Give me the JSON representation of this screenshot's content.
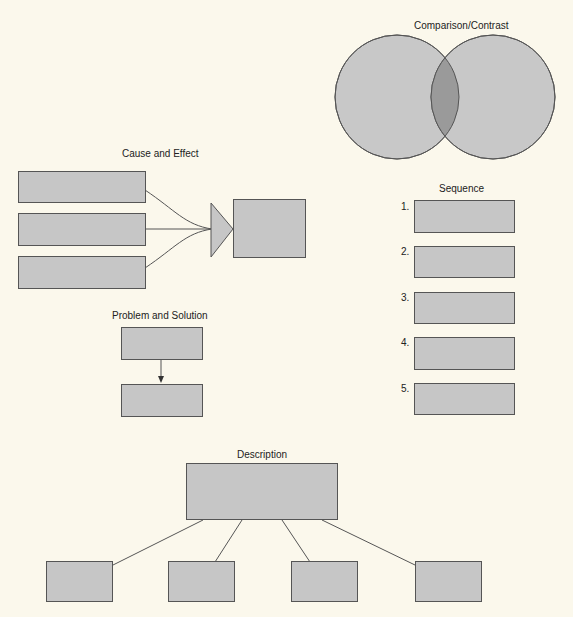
{
  "diagrams": {
    "comparison": {
      "title": "Comparison/Contrast"
    },
    "cause_effect": {
      "title": "Cause and Effect"
    },
    "sequence": {
      "title": "Sequence",
      "steps": [
        "1.",
        "2.",
        "3.",
        "4.",
        "5."
      ]
    },
    "problem_solution": {
      "title": "Problem and Solution"
    },
    "description": {
      "title": "Description"
    }
  },
  "colors": {
    "background": "#fbf8ec",
    "box_fill": "#c6c6c6",
    "overlap_fill": "#9a9a9a",
    "stroke": "#555555"
  }
}
